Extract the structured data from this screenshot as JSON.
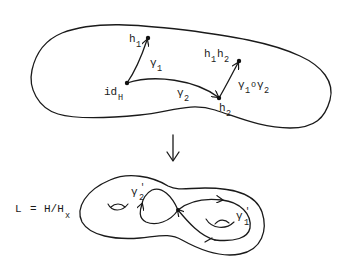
{
  "diagram": {
    "top_space": {
      "points": [
        {
          "id": "idH",
          "label": "id",
          "sub": "H"
        },
        {
          "id": "h1",
          "label": "h",
          "sub": "1"
        },
        {
          "id": "h2",
          "label": "h",
          "sub": "2"
        },
        {
          "id": "h1h2",
          "label": "h",
          "sub": "1",
          "label2": "h",
          "sub2": "2"
        }
      ],
      "paths": [
        {
          "id": "gamma1",
          "label": "γ",
          "sub": "1",
          "from": "idH",
          "to": "h1"
        },
        {
          "id": "gamma2",
          "label": "γ",
          "sub": "2",
          "from": "idH",
          "to": "h2"
        },
        {
          "id": "gamma1_o_gamma2",
          "label": "γ",
          "sub": "1",
          "mid": "o",
          "label2": "γ",
          "sub2": "2",
          "from": "h2",
          "to": "h1h2"
        }
      ]
    },
    "map_arrow": {
      "symbol": "↓"
    },
    "bottom_space": {
      "equation": {
        "lhs": "L",
        "eq": "=",
        "rhs": "H/H",
        "rhs_sub": "x"
      },
      "loops": [
        {
          "id": "gamma2_prime",
          "label": "γ",
          "sup": "'",
          "sub": "2"
        },
        {
          "id": "gamma1_prime",
          "label": "γ",
          "sup": "'",
          "sub": "1"
        }
      ],
      "surface": "genus-2 surface"
    }
  },
  "colors": {
    "ink": "#1a1a1a",
    "background": "#ffffff"
  }
}
